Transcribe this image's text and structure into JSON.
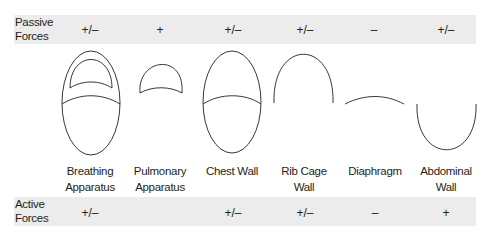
{
  "rows": {
    "passive": {
      "label": "Passive Forces",
      "label_line1": "Passive",
      "label_line2": "Forces",
      "values": [
        "+/–",
        "+",
        "+/–",
        "+/–",
        "–",
        "+/–"
      ]
    },
    "active": {
      "label": "Active Forces",
      "label_line1": "Active",
      "label_line2": "Forces",
      "values": [
        "+/–",
        "",
        "+/–",
        "+/–",
        "–",
        "+"
      ]
    }
  },
  "components": [
    {
      "line1": "Breathing",
      "line2": "Apparatus",
      "shape": "breathing-apparatus-diagram"
    },
    {
      "line1": "Pulmonary",
      "line2": "Apparatus",
      "shape": "pulmonary-apparatus-diagram"
    },
    {
      "line1": "Chest Wall",
      "line2": "",
      "shape": "chest-wall-diagram"
    },
    {
      "line1": "Rib Cage",
      "line2": "Wall",
      "shape": "rib-cage-wall-diagram"
    },
    {
      "line1": "Diaphragm",
      "line2": "",
      "shape": "diaphragm-diagram"
    },
    {
      "line1": "Abdominal",
      "line2": "Wall",
      "shape": "abdominal-wall-diagram"
    }
  ],
  "colors": {
    "band": "#ececec",
    "stroke": "#231f20"
  }
}
